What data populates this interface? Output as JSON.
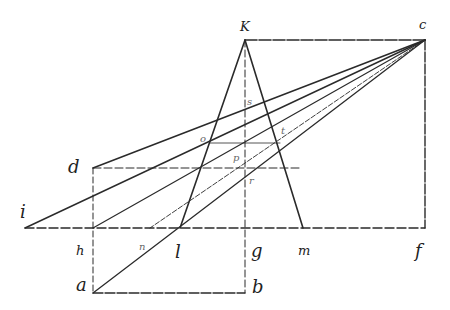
{
  "diagram": {
    "title": "",
    "labels": [
      {
        "id": "K",
        "text": "K",
        "x": 240,
        "y": 20,
        "size": "med"
      },
      {
        "id": "C",
        "text": "c",
        "x": 419,
        "y": 18,
        "size": "med"
      },
      {
        "id": "d",
        "text": "d",
        "x": 68,
        "y": 158,
        "size": "big"
      },
      {
        "id": "i",
        "text": "i",
        "x": 20,
        "y": 203,
        "size": "big"
      },
      {
        "id": "h",
        "text": "h",
        "x": 76,
        "y": 244,
        "size": "med"
      },
      {
        "id": "n",
        "text": "n",
        "x": 139,
        "y": 242,
        "size": "small"
      },
      {
        "id": "l",
        "text": "l",
        "x": 175,
        "y": 243,
        "size": "big"
      },
      {
        "id": "g",
        "text": "g",
        "x": 251,
        "y": 242,
        "size": "big"
      },
      {
        "id": "m",
        "text": "m",
        "x": 298,
        "y": 244,
        "size": "med"
      },
      {
        "id": "f",
        "text": "f",
        "x": 415,
        "y": 242,
        "size": "big"
      },
      {
        "id": "a",
        "text": "a",
        "x": 76,
        "y": 276,
        "size": "big"
      },
      {
        "id": "b",
        "text": "b",
        "x": 252,
        "y": 278,
        "size": "big"
      },
      {
        "id": "s",
        "text": "s",
        "x": 247,
        "y": 97,
        "size": "small"
      },
      {
        "id": "o",
        "text": "o",
        "x": 200,
        "y": 134,
        "size": "small"
      },
      {
        "id": "t",
        "text": "t",
        "x": 281,
        "y": 126,
        "size": "small"
      },
      {
        "id": "p",
        "text": "p",
        "x": 233,
        "y": 153,
        "size": "small"
      },
      {
        "id": "r",
        "text": "r",
        "x": 249,
        "y": 176,
        "size": "small"
      }
    ]
  }
}
